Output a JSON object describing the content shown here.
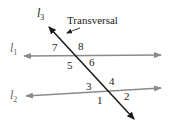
{
  "diagram": {
    "title_callout": "Transversal",
    "colors": {
      "parallel_lines": "#8a8a8a",
      "transversal": "#1a1a1a",
      "text": "#222222",
      "background": "#ffffff"
    },
    "lines": [
      {
        "id": "l1",
        "name": "l",
        "subscript": "1",
        "kind": "parallel"
      },
      {
        "id": "l2",
        "name": "l",
        "subscript": "2",
        "kind": "parallel"
      },
      {
        "id": "l3",
        "name": "l",
        "subscript": "3",
        "kind": "transversal"
      }
    ],
    "angles": {
      "top_intersection": {
        "upper_left": "7",
        "upper_right": "8",
        "lower_left": "5",
        "lower_right": "6"
      },
      "bottom_intersection": {
        "upper_left": "3",
        "upper_right": "4",
        "lower_left": "1",
        "lower_right": "2"
      }
    }
  }
}
